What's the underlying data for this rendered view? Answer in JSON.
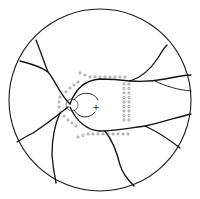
{
  "diagram": {
    "type": "retinal-fundus-drawing",
    "elements": {
      "fundus_boundary": "circle",
      "optic_disc": "small-circle",
      "fovea_marker": "+",
      "vessels": "branching-dark-lines",
      "laser_spots": "small-open-circles"
    },
    "colors": {
      "stroke": "#111111",
      "laser": "#666666",
      "background": "#ffffff"
    },
    "fovea_label": "+"
  }
}
